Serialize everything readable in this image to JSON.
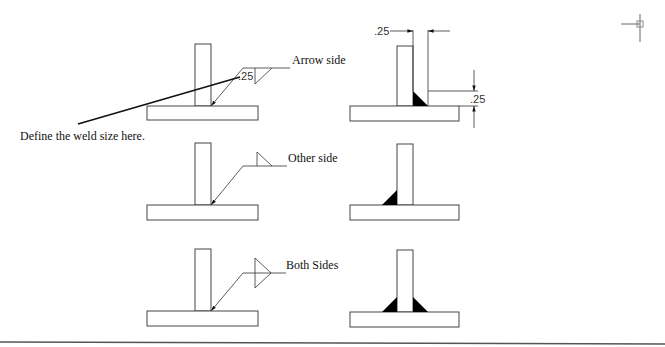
{
  "diagram": {
    "callout": {
      "text": "Define the weld size here."
    },
    "rows": [
      {
        "id": "arrow-side",
        "label": "Arrow side",
        "weld_size": ".25",
        "symbol": "fillet below reference line",
        "result": "fillet on arrow side"
      },
      {
        "id": "other-side",
        "label": "Other side",
        "symbol": "fillet above reference line",
        "result": "fillet on other side"
      },
      {
        "id": "both-sides",
        "label": "Both Sides",
        "symbol": "fillet above and below reference line",
        "result": "fillets on both sides"
      }
    ],
    "dimensions": {
      "horizontal": ".25",
      "vertical": ".25"
    }
  },
  "colors": {
    "background": "#ffffff",
    "line": "#333333",
    "weld_fill": "#000000"
  }
}
